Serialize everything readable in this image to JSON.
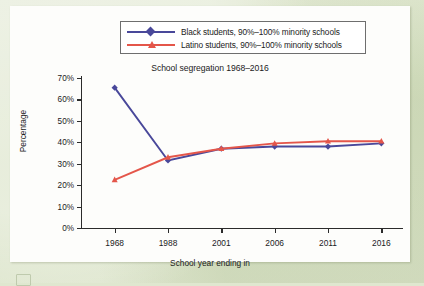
{
  "page": {
    "background_color": "#dfe7cf",
    "card_color": "#fdfdfb"
  },
  "legend": {
    "position": "top-center",
    "entries": [
      {
        "label": "Black students, 90%–100% minority schools",
        "color": "#49489a",
        "marker": "diamond"
      },
      {
        "label": "Latino students, 90%–100% minority schools",
        "color": "#e4564a",
        "marker": "triangle"
      }
    ]
  },
  "chart_data": {
    "type": "line",
    "title": "School segregation 1968–2016",
    "xlabel": "School year ending in",
    "ylabel": "Percentage",
    "categories": [
      "1968",
      "1988",
      "2001",
      "2006",
      "2011",
      "2016"
    ],
    "ylim": [
      0,
      70
    ],
    "ytick_labels": [
      "0%",
      "10%",
      "20%",
      "30%",
      "40%",
      "50%",
      "60%",
      "70%"
    ],
    "ytick_values": [
      0,
      10,
      20,
      30,
      40,
      50,
      60,
      70
    ],
    "grid": false,
    "legend_position": "top-center",
    "series": [
      {
        "name": "Black students, 90%–100% minority schools",
        "color": "#49489a",
        "marker": "diamond",
        "values": [
          65.5,
          31.5,
          37.0,
          38.0,
          38.0,
          39.5
        ]
      },
      {
        "name": "Latino students, 90%–100% minority schools",
        "color": "#e4564a",
        "marker": "triangle",
        "values": [
          22.5,
          33.0,
          37.0,
          39.5,
          40.5,
          40.5
        ]
      }
    ]
  }
}
